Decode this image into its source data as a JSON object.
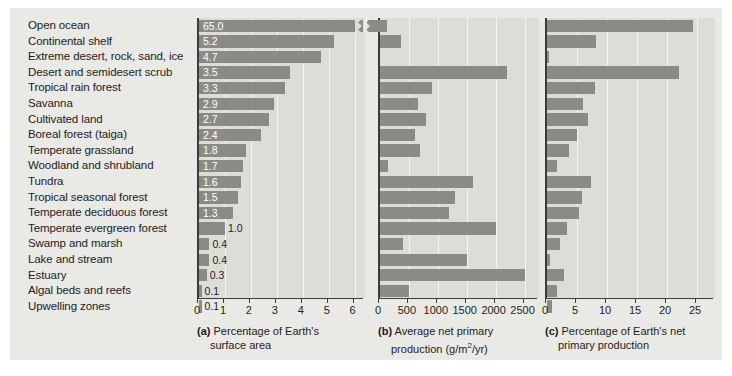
{
  "figure": {
    "background_color": "#e9e9e5",
    "panel_color": "#dcdcd8",
    "bar_color": "#8b8b86",
    "axis_color": "#3b3b3b"
  },
  "categories": [
    "Open ocean",
    "Continental shelf",
    "Extreme desert, rock, sand, ice",
    "Desert and semidesert scrub",
    "Tropical rain forest",
    "Savanna",
    "Cultivated land",
    "Boreal forest (taiga)",
    "Temperate grassland",
    "Woodland and shrubland",
    "Tundra",
    "Tropical seasonal forest",
    "Temperate deciduous forest",
    "Temperate evergreen forest",
    "Swamp and marsh",
    "Lake and stream",
    "Estuary",
    "Algal beds and reefs",
    "Upwelling zones"
  ],
  "chart_data": [
    {
      "type": "bar",
      "panel": "a",
      "title": "Percentage of Earth's surface area",
      "caption_prefix": "(a)",
      "caption_line1": "Percentage of Earth's",
      "caption_line2": "surface area",
      "orientation": "horizontal",
      "xlabel": "",
      "ylabel": "",
      "xlim": [
        0,
        6.4
      ],
      "ticks": [
        0,
        1,
        2,
        3,
        4,
        5,
        6
      ],
      "tick_labels": [
        "0",
        "1",
        "2",
        "3",
        "4",
        "5",
        "6"
      ],
      "grid": true,
      "axis_break": true,
      "axis_break_note": "Open ocean bar (65.0) exceeds the axis and is drawn with a break mark",
      "categories": [
        "Open ocean",
        "Continental shelf",
        "Extreme desert, rock, sand, ice",
        "Desert and semidesert scrub",
        "Tropical rain forest",
        "Savanna",
        "Cultivated land",
        "Boreal forest (taiga)",
        "Temperate grassland",
        "Woodland and shrubland",
        "Tundra",
        "Tropical seasonal forest",
        "Temperate deciduous forest",
        "Temperate evergreen forest",
        "Swamp and marsh",
        "Lake and stream",
        "Estuary",
        "Algal beds and reefs",
        "Upwelling zones"
      ],
      "values": [
        65.0,
        5.2,
        4.7,
        3.5,
        3.3,
        2.9,
        2.7,
        2.4,
        1.8,
        1.7,
        1.6,
        1.5,
        1.3,
        1.0,
        0.4,
        0.4,
        0.3,
        0.1,
        0.1
      ],
      "value_labels": [
        "65.0",
        "5.2",
        "4.7",
        "3.5",
        "3.3",
        "2.9",
        "2.7",
        "2.4",
        "1.8",
        "1.7",
        "1.6",
        "1.5",
        "1.3",
        "1.0",
        "0.4",
        "0.4",
        "0.3",
        "0.1",
        "0.1"
      ]
    },
    {
      "type": "bar",
      "panel": "b",
      "title": "Average net primary production (g/m2/yr)",
      "caption_prefix": "(b)",
      "caption_line1": "Average net primary",
      "caption_line2_a": "production (g/m",
      "caption_line2_sup": "2",
      "caption_line2_b": "/yr)",
      "orientation": "horizontal",
      "xlabel": "g/m2/yr",
      "ylabel": "",
      "xlim": [
        0,
        2750
      ],
      "ticks": [
        0,
        500,
        1000,
        1500,
        2000,
        2500
      ],
      "tick_labels": [
        "0",
        "500",
        "1000",
        "1500",
        "2000",
        "2500"
      ],
      "grid": true,
      "values": [
        125,
        360,
        3,
        2200,
        900,
        650,
        800,
        600,
        700,
        140,
        1600,
        1300,
        1200,
        2000,
        400,
        1500,
        2500,
        500,
        0
      ]
    },
    {
      "type": "bar",
      "panel": "c",
      "title": "Percentage of Earth's net primary production",
      "caption_prefix": "(c)",
      "caption_line1": "Percentage of Earth's net",
      "caption_line2": "primary production",
      "orientation": "horizontal",
      "xlabel": "",
      "ylabel": "",
      "xlim": [
        0,
        28
      ],
      "ticks": [
        0,
        5,
        10,
        15,
        20,
        25
      ],
      "tick_labels": [
        "0",
        "5",
        "10",
        "15",
        "20",
        "25"
      ],
      "grid": true,
      "values": [
        24.4,
        8.2,
        0.3,
        22.0,
        8.0,
        6.0,
        6.8,
        5.0,
        3.6,
        1.6,
        7.4,
        5.8,
        5.4,
        3.4,
        2.2,
        0.5,
        2.8,
        1.6,
        0.9
      ]
    }
  ]
}
